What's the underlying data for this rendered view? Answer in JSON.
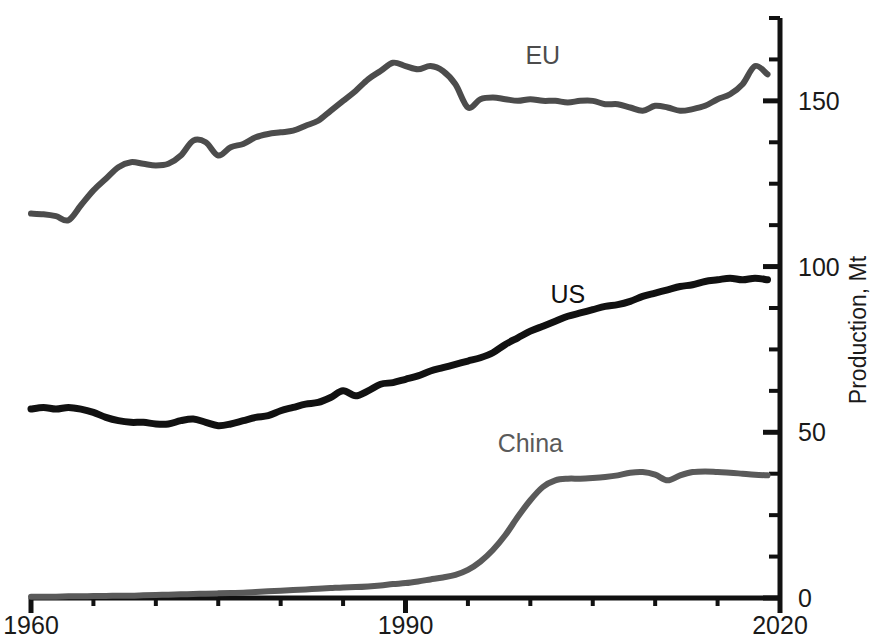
{
  "chart_data": {
    "type": "line",
    "title": "",
    "subtitle": "",
    "xlabel": "",
    "ylabel": "Production, Mt",
    "xlim": [
      1960,
      2020
    ],
    "ylim": [
      0,
      175
    ],
    "grid": false,
    "legend_position": "inline-end-of-series",
    "x_ticks_major": [
      1960,
      1990,
      2020
    ],
    "x_tick_labels": [
      "1960",
      "1990",
      "2020"
    ],
    "x_ticks_minor_step": 5,
    "y_ticks_major": [
      0,
      50,
      100,
      150
    ],
    "y_tick_labels": [
      "0",
      "50",
      "100",
      "150"
    ],
    "y_ticks_minor_step": 12.5,
    "axis_side_y": "right",
    "colors": {
      "eu": "#4c4c4c",
      "us": "#111111",
      "china": "#5a5a5a",
      "axis": "#111111",
      "background": "#ffffff"
    },
    "series": [
      {
        "name": "EU",
        "label": "EU",
        "color": "#4c4c4c",
        "label_x": 2001,
        "label_y": 161,
        "x": [
          1960,
          1961,
          1962,
          1963,
          1964,
          1965,
          1966,
          1967,
          1968,
          1969,
          1970,
          1971,
          1972,
          1973,
          1974,
          1975,
          1976,
          1977,
          1978,
          1979,
          1980,
          1981,
          1982,
          1983,
          1984,
          1985,
          1986,
          1987,
          1988,
          1989,
          1990,
          1991,
          1992,
          1993,
          1994,
          1995,
          1996,
          1997,
          1998,
          1999,
          2000,
          2001,
          2002,
          2003,
          2004,
          2005,
          2006,
          2007,
          2008,
          2009,
          2010,
          2011,
          2012,
          2013,
          2014,
          2015,
          2016,
          2017,
          2018,
          2019
        ],
        "values": [
          116.0,
          115.8,
          115.2,
          114.0,
          118.5,
          123.0,
          126.5,
          130.0,
          131.5,
          131.0,
          130.5,
          131.0,
          133.5,
          138.0,
          137.5,
          133.5,
          136.0,
          137.0,
          139.0,
          140.0,
          140.5,
          141.0,
          142.5,
          144.0,
          147.0,
          150.0,
          153.0,
          156.5,
          159.0,
          161.5,
          160.5,
          159.5,
          160.5,
          159.0,
          155.0,
          148.0,
          150.5,
          151.0,
          150.5,
          150.0,
          150.5,
          150.0,
          150.0,
          149.5,
          150.0,
          150.0,
          149.0,
          149.0,
          148.0,
          147.0,
          148.5,
          148.0,
          147.0,
          147.5,
          148.5,
          150.5,
          152.0,
          155.0,
          160.5,
          158.0
        ]
      },
      {
        "name": "US",
        "label": "US",
        "color": "#111111",
        "label_x": 2003,
        "label_y": 89,
        "x": [
          1960,
          1961,
          1962,
          1963,
          1964,
          1965,
          1966,
          1967,
          1968,
          1969,
          1970,
          1971,
          1972,
          1973,
          1974,
          1975,
          1976,
          1977,
          1978,
          1979,
          1980,
          1981,
          1982,
          1983,
          1984,
          1985,
          1986,
          1987,
          1988,
          1989,
          1990,
          1991,
          1992,
          1993,
          1994,
          1995,
          1996,
          1997,
          1998,
          1999,
          2000,
          2001,
          2002,
          2003,
          2004,
          2005,
          2006,
          2007,
          2008,
          2009,
          2010,
          2011,
          2012,
          2013,
          2014,
          2015,
          2016,
          2017,
          2018,
          2019
        ],
        "values": [
          57.0,
          57.5,
          57.0,
          57.5,
          57.0,
          56.0,
          54.5,
          53.5,
          53.0,
          53.0,
          52.5,
          52.5,
          53.5,
          54.0,
          53.0,
          52.0,
          52.5,
          53.5,
          54.5,
          55.0,
          56.5,
          57.5,
          58.5,
          59.0,
          60.5,
          62.5,
          61.0,
          62.5,
          64.5,
          65.0,
          66.0,
          67.0,
          68.5,
          69.5,
          70.5,
          71.5,
          72.5,
          74.0,
          76.5,
          78.5,
          80.5,
          82.0,
          83.5,
          85.0,
          86.0,
          87.0,
          88.0,
          88.5,
          89.5,
          91.0,
          92.0,
          93.0,
          94.0,
          94.5,
          95.5,
          96.0,
          96.5,
          96.0,
          96.5,
          96.0
        ]
      },
      {
        "name": "China",
        "label": "China",
        "color": "#5a5a5a",
        "label_x": 2000,
        "label_y": 44,
        "x": [
          1960,
          1961,
          1962,
          1963,
          1964,
          1965,
          1966,
          1967,
          1968,
          1969,
          1970,
          1971,
          1972,
          1973,
          1974,
          1975,
          1976,
          1977,
          1978,
          1979,
          1980,
          1981,
          1982,
          1983,
          1984,
          1985,
          1986,
          1987,
          1988,
          1989,
          1990,
          1991,
          1992,
          1993,
          1994,
          1995,
          1996,
          1997,
          1998,
          1999,
          2000,
          2001,
          2002,
          2003,
          2004,
          2005,
          2006,
          2007,
          2008,
          2009,
          2010,
          2011,
          2012,
          2013,
          2014,
          2015,
          2016,
          2017,
          2018,
          2019
        ],
        "values": [
          0.4,
          0.4,
          0.4,
          0.5,
          0.5,
          0.6,
          0.6,
          0.7,
          0.7,
          0.8,
          0.9,
          1.0,
          1.1,
          1.2,
          1.3,
          1.4,
          1.5,
          1.6,
          1.8,
          2.0,
          2.2,
          2.4,
          2.6,
          2.8,
          3.0,
          3.2,
          3.3,
          3.5,
          3.8,
          4.2,
          4.5,
          5.0,
          5.6,
          6.2,
          7.0,
          8.5,
          11.0,
          14.5,
          19.0,
          24.5,
          29.5,
          33.5,
          35.5,
          36.0,
          36.0,
          36.2,
          36.5,
          37.0,
          37.8,
          38.0,
          37.2,
          35.5,
          37.0,
          38.0,
          38.2,
          38.0,
          37.8,
          37.5,
          37.2,
          37.0
        ]
      }
    ]
  },
  "axis": {
    "y_title": "Production, Mt",
    "x_labels": [
      "1960",
      "1990",
      "2020"
    ],
    "y_labels": [
      "0",
      "50",
      "100",
      "150"
    ]
  },
  "caption": {
    "text": ""
  }
}
